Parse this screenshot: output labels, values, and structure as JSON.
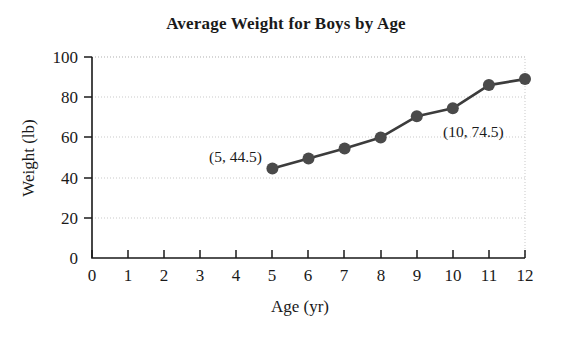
{
  "chart_data": {
    "type": "scatter",
    "title": "Average Weight for Boys  by Age",
    "xlabel": "Age (yr)",
    "ylabel": "Weight (lb)",
    "x": [
      5,
      6,
      7,
      8,
      9,
      10,
      11,
      12
    ],
    "values": [
      44.5,
      49.5,
      54.5,
      60,
      70.5,
      74.5,
      86,
      89
    ],
    "series": [
      {
        "name": "Average weight",
        "x": [
          5,
          6,
          7,
          8,
          9,
          10,
          11,
          12
        ],
        "values": [
          44.5,
          49.5,
          54.5,
          60,
          70.5,
          74.5,
          86,
          89
        ]
      }
    ],
    "xlim": [
      0,
      12
    ],
    "ylim": [
      0,
      100
    ],
    "xticks": [
      "0",
      "1",
      "2",
      "3",
      "4",
      "5",
      "6",
      "7",
      "8",
      "9",
      "10",
      "11",
      "12"
    ],
    "yticks": [
      "0",
      "20",
      "40",
      "60",
      "80",
      "100"
    ],
    "grid": "horizontal-dotted",
    "legend": "none",
    "marker_color": "#4a4a4a",
    "line_color": "#3c3c3c",
    "annotations": [
      {
        "label": "(5, 44.5)",
        "x": 5,
        "y": 44.5
      },
      {
        "label": "(10, 74.5)",
        "x": 10,
        "y": 74.5
      }
    ]
  }
}
